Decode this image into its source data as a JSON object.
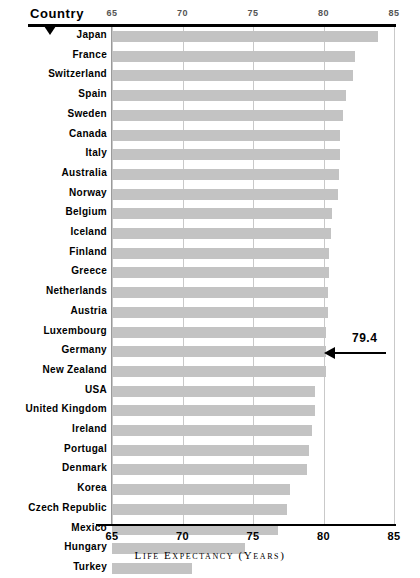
{
  "header": {
    "country_label": "Country",
    "pointer_icon": "triangle-down-icon"
  },
  "axis_caption": "Life Expectancy (Years)",
  "top_ticks": [
    "65",
    "70",
    "75",
    "80",
    "85"
  ],
  "bottom_ticks": [
    "65",
    "70",
    "75",
    "80",
    "85"
  ],
  "annotation": {
    "value": "79.4",
    "target": "USA",
    "icon": "arrow-left-icon"
  },
  "colors": {
    "bar": "#c3c3c3",
    "gridline": "#c9c9c9",
    "rule": "#000000",
    "top_tick_text": "#555555"
  },
  "chart_data": {
    "type": "bar",
    "orientation": "horizontal",
    "title": "",
    "xlabel": "Life Expectancy (Years)",
    "ylabel": "Country",
    "xlim": [
      65,
      85
    ],
    "xticks": [
      65,
      70,
      75,
      80,
      85
    ],
    "grid": true,
    "legend": false,
    "categories": [
      "Japan",
      "France",
      "Switzerland",
      "Spain",
      "Sweden",
      "Canada",
      "Italy",
      "Australia",
      "Norway",
      "Belgium",
      "Iceland",
      "Finland",
      "Greece",
      "Netherlands",
      "Austria",
      "Luxembourg",
      "Germany",
      "New Zealand",
      "USA",
      "United Kingdom",
      "Ireland",
      "Portugal",
      "Denmark",
      "Korea",
      "Czech Republic",
      "Mexico",
      "Hungary",
      "Turkey"
    ],
    "values": [
      83.9,
      82.2,
      82.1,
      81.6,
      81.4,
      81.2,
      81.2,
      81.1,
      81.0,
      80.6,
      80.5,
      80.4,
      80.4,
      80.3,
      80.3,
      80.2,
      80.2,
      80.2,
      79.4,
      79.4,
      79.2,
      79.0,
      78.8,
      77.6,
      77.4,
      76.8,
      74.4,
      70.7
    ],
    "annotations": [
      {
        "label": "79.4",
        "category": "USA",
        "value": 79.4
      }
    ]
  }
}
